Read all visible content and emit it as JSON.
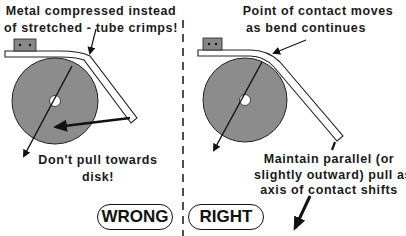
{
  "diagram": {
    "colors": {
      "disk_fill": "#8c8c8c",
      "outline": "#111111",
      "clamp_fill": "#888888",
      "background": "#ffffff"
    },
    "panels": [
      {
        "id": "wrong",
        "badge": "WRONG",
        "top_note": [
          "Metal compressed instead",
          "of stretched - tube crimps!"
        ],
        "bottom_note": [
          "Don't pull towards",
          "disk!"
        ]
      },
      {
        "id": "right",
        "badge": "RIGHT",
        "top_note": [
          "Point of contact moves",
          "as bend continues"
        ],
        "bottom_note": [
          "Maintain parallel (or",
          "slightly outward) pull as",
          "axis of contact shifts"
        ]
      }
    ],
    "separator": "dashed-vertical-line"
  }
}
